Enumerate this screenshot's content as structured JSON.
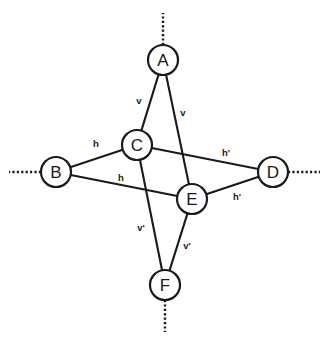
{
  "diagram": {
    "type": "node-link-graph",
    "width": 329,
    "height": 343,
    "background_color": "#ffffff",
    "stroke_color": "#1a1a1a",
    "node_radius": 15,
    "nodes": [
      {
        "id": "A",
        "label": "A",
        "x": 163,
        "y": 60
      },
      {
        "id": "B",
        "label": "B",
        "x": 56,
        "y": 172
      },
      {
        "id": "C",
        "label": "C",
        "x": 137,
        "y": 145
      },
      {
        "id": "D",
        "label": "D",
        "x": 273,
        "y": 172
      },
      {
        "id": "E",
        "label": "E",
        "x": 192,
        "y": 199
      },
      {
        "id": "F",
        "label": "F",
        "x": 165,
        "y": 285
      }
    ],
    "edges": [
      {
        "id": "A-C",
        "from": "A",
        "to": "C",
        "label": "v",
        "label_x": 139,
        "label_y": 100
      },
      {
        "id": "A-E",
        "from": "A",
        "to": "E",
        "label": "v",
        "label_x": 183,
        "label_y": 112
      },
      {
        "id": "B-C",
        "from": "B",
        "to": "C",
        "label": "h",
        "label_x": 96,
        "label_y": 143
      },
      {
        "id": "B-E",
        "from": "B",
        "to": "E",
        "label": "h",
        "label_x": 121,
        "label_y": 177
      },
      {
        "id": "C-D",
        "from": "C",
        "to": "D",
        "label": "h'",
        "label_x": 226,
        "label_y": 152
      },
      {
        "id": "E-D",
        "from": "E",
        "to": "D",
        "label": "h'",
        "label_x": 237,
        "label_y": 196
      },
      {
        "id": "C-F",
        "from": "C",
        "to": "F",
        "label": "v'",
        "label_x": 141,
        "label_y": 227
      },
      {
        "id": "E-F",
        "from": "E",
        "to": "F",
        "label": "v'",
        "label_x": 187,
        "label_y": 245
      }
    ],
    "rays": [
      {
        "id": "ray-A-up",
        "from": "A",
        "direction": "up",
        "x1": 163,
        "y1": 45,
        "x2": 163,
        "y2": 13
      },
      {
        "id": "ray-B-left",
        "from": "B",
        "direction": "left",
        "x1": 41,
        "y1": 172,
        "x2": 9,
        "y2": 172
      },
      {
        "id": "ray-D-right",
        "from": "D",
        "direction": "right",
        "x1": 288,
        "y1": 172,
        "x2": 320,
        "y2": 172
      },
      {
        "id": "ray-F-down",
        "from": "F",
        "direction": "down",
        "x1": 165,
        "y1": 300,
        "x2": 165,
        "y2": 332
      }
    ]
  }
}
